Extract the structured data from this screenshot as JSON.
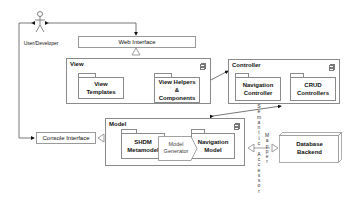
{
  "actor": {
    "label": "User/Developer",
    "icon": "stick-figure-actor"
  },
  "web_interface": {
    "label": "Web Interface"
  },
  "console_interface": {
    "label": "Console Interface"
  },
  "view": {
    "title": "View",
    "components": [
      {
        "label": "View\nTemplates"
      },
      {
        "label": "View Helpers\n&\nComponents"
      }
    ]
  },
  "controller": {
    "title": "Controller",
    "components": [
      {
        "label": "Navigation\nController"
      },
      {
        "label": "CRUD\nControllers"
      }
    ]
  },
  "model": {
    "title": "Model",
    "components": [
      {
        "label": "SHDM\nMetamodel"
      },
      {
        "label": "Model\nGenerator"
      },
      {
        "label": "Navigation\nModel"
      }
    ]
  },
  "semantic_accessor": {
    "label": "Semantic\nAccessor"
  },
  "mapper": {
    "label": "Mapper"
  },
  "database": {
    "label": "Database\nBackend"
  },
  "colors": {
    "line": "#8a8a8a",
    "text": "#111111",
    "background": "#ffffff"
  }
}
